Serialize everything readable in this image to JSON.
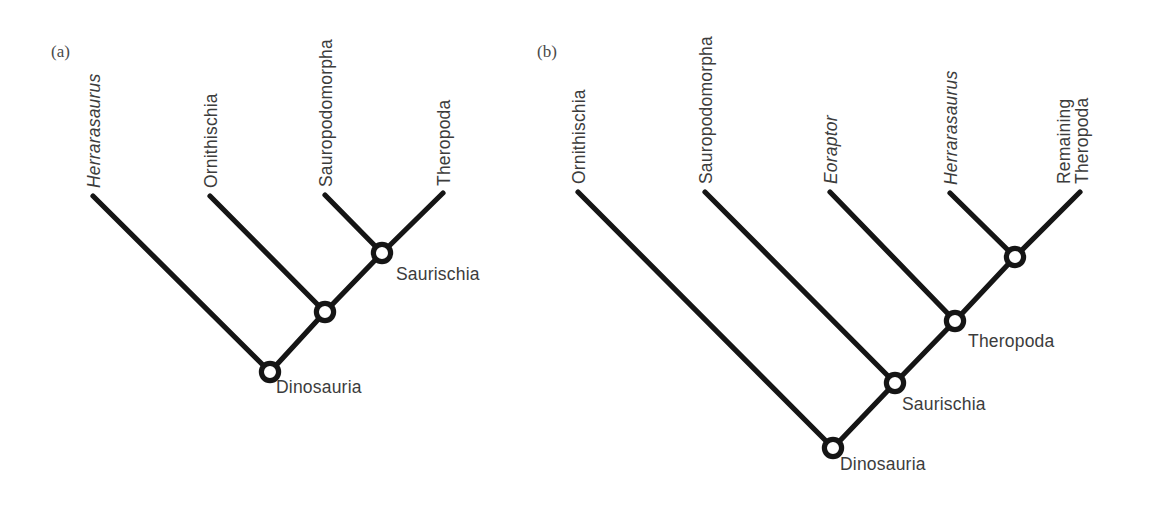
{
  "figure": {
    "background_color": "#ffffff",
    "line_color": "#151515",
    "text_color": "#3c3c3c",
    "node_fill_color": "#ffffff"
  },
  "panels": [
    {
      "id": "a",
      "marker": "(a)",
      "tips": [
        {
          "name": "herrarasaurus",
          "label": "Herrarasaurus",
          "italic": true
        },
        {
          "name": "ornithischia",
          "label": "Ornithischia",
          "italic": false
        },
        {
          "name": "sauropodomorpha",
          "label": "Sauropodomorpha",
          "italic": false
        },
        {
          "name": "theropoda",
          "label": "Theropoda",
          "italic": false
        }
      ],
      "nodes": [
        {
          "name": "dinosauria",
          "label": "Dinosauria"
        },
        {
          "name": "unlabeled-node",
          "label": ""
        },
        {
          "name": "saurischia",
          "label": "Saurischia"
        }
      ]
    },
    {
      "id": "b",
      "marker": "(b)",
      "tips": [
        {
          "name": "ornithischia",
          "label": "Ornithischia",
          "italic": false
        },
        {
          "name": "sauropodomorpha",
          "label": "Sauropodomorpha",
          "italic": false
        },
        {
          "name": "eoraptor",
          "label": "Eoraptor",
          "italic": true
        },
        {
          "name": "herrarasaurus",
          "label": "Herrarasaurus",
          "italic": true
        },
        {
          "name": "remaining-theropoda-line1",
          "label": "Remaining",
          "italic": false
        },
        {
          "name": "remaining-theropoda-line2",
          "label": "Theropoda",
          "italic": false
        }
      ],
      "nodes": [
        {
          "name": "dinosauria",
          "label": "Dinosauria"
        },
        {
          "name": "saurischia",
          "label": "Saurischia"
        },
        {
          "name": "theropoda",
          "label": "Theropoda"
        },
        {
          "name": "unlabeled-node",
          "label": ""
        }
      ]
    }
  ]
}
